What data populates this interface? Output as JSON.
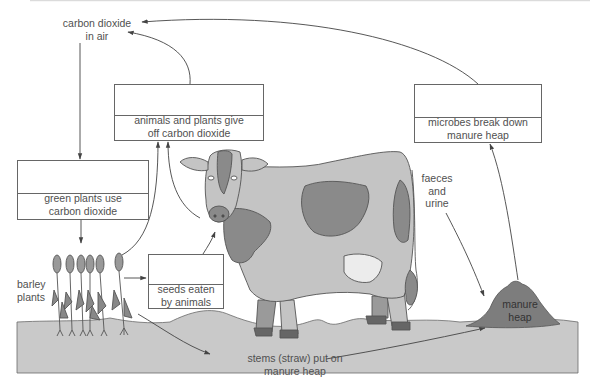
{
  "diagram": {
    "type": "cycle-diagram",
    "labels": {
      "co2_air_line1": "carbon dioxide",
      "co2_air_line2": "in air",
      "barley_line1": "barley",
      "barley_line2": "plants",
      "faeces_line1": "faeces",
      "faeces_line2": "and",
      "faeces_line3": "urine",
      "manure_line1": "manure",
      "manure_line2": "heap",
      "stems_line1": "stems (straw) put on",
      "stems_line2": "manure heap"
    },
    "boxes": [
      {
        "id": "respiration",
        "answer_blank": "",
        "line1": "animals and plants give",
        "line2": "off carbon dioxide"
      },
      {
        "id": "decomposition",
        "answer_blank": "",
        "line1": "microbes break down",
        "line2": "manure heap"
      },
      {
        "id": "photosynthesis",
        "answer_blank": "",
        "line1": "green plants use",
        "line2": "carbon dioxide"
      },
      {
        "id": "feeding",
        "answer_blank": "",
        "line1": "seeds eaten",
        "line2": "by animals"
      }
    ],
    "arrows": [
      {
        "from": "manure heap / microbes box",
        "to": "carbon dioxide in air"
      },
      {
        "from": "animals and plants box",
        "to": "carbon dioxide in air"
      },
      {
        "from": "carbon dioxide in air",
        "to": "green plants box"
      },
      {
        "from": "green plants box",
        "to": "barley plants"
      },
      {
        "from": "barley plants",
        "to": "animals and plants box"
      },
      {
        "from": "cow",
        "to": "animals and plants box"
      },
      {
        "from": "barley plants",
        "to": "seeds eaten box"
      },
      {
        "from": "seeds eaten box",
        "to": "cow"
      },
      {
        "from": "barley plants",
        "to": "stems (straw)"
      },
      {
        "from": "stems (straw)",
        "to": "manure heap"
      },
      {
        "from": "faeces and urine",
        "to": "manure heap"
      },
      {
        "from": "manure heap",
        "to": "microbes box"
      }
    ],
    "colors": {
      "ground": "#c9c9c9",
      "manure": "#7d7d7d",
      "cow_body": "#c4c4c4",
      "cow_patch": "#8a8a8a",
      "udder": "#ececec",
      "line": "#444444",
      "text": "#505050"
    }
  }
}
